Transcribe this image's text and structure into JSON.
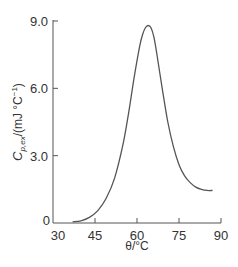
{
  "chart_data": {
    "type": "line",
    "title": "",
    "xlabel": "θ/°C",
    "ylabel": "C_p,ex/(mJ °C⁻¹)",
    "ylabel_parts": {
      "main": "C",
      "sub": "p,ex",
      "rest": "/(mJ °C",
      "sup": "−1",
      "close": ")"
    },
    "xlim": [
      30,
      90
    ],
    "ylim": [
      0,
      9.0
    ],
    "x_ticks": [
      30,
      45,
      60,
      75,
      90
    ],
    "x_tick_labels": [
      "30",
      "45",
      "60",
      "75",
      "90"
    ],
    "y_ticks": [
      0,
      3.0,
      6.0,
      9.0
    ],
    "y_tick_labels": [
      "0",
      "3.0",
      "6.0",
      "9.0"
    ],
    "grid": false,
    "legend": null,
    "series": [
      {
        "name": "excess heat capacity",
        "color": "#555555",
        "x": [
          37,
          40,
          43,
          46,
          49,
          52,
          55,
          57,
          59,
          61,
          62,
          63,
          64,
          65,
          66,
          67,
          69,
          71,
          73,
          75,
          77,
          79,
          81,
          83,
          85,
          87
        ],
        "y": [
          0.05,
          0.1,
          0.25,
          0.55,
          1.1,
          2.0,
          3.5,
          4.9,
          6.5,
          7.9,
          8.4,
          8.7,
          8.8,
          8.7,
          8.3,
          7.6,
          6.0,
          4.5,
          3.4,
          2.6,
          2.1,
          1.8,
          1.6,
          1.5,
          1.45,
          1.45
        ]
      }
    ]
  }
}
